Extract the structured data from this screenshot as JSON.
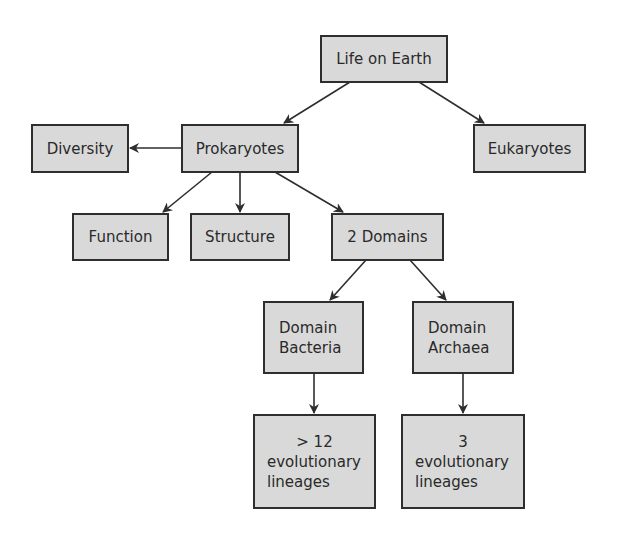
{
  "diagram": {
    "title": "Life on Earth",
    "colors": {
      "background": "#ffffff",
      "node_fill": "#d9d9d9",
      "node_border": "#2e2e2e",
      "text": "#2a2a2a",
      "edge": "#2e2e2e"
    },
    "nodes": {
      "life_on_earth": {
        "label": "Life on Earth"
      },
      "prokaryotes": {
        "label": "Prokaryotes"
      },
      "eukaryotes": {
        "label": "Eukaryotes"
      },
      "diversity": {
        "label": "Diversity"
      },
      "function": {
        "label": "Function"
      },
      "structure": {
        "label": "Structure"
      },
      "two_domains": {
        "label": "2 Domains"
      },
      "domain_bacteria": {
        "lines": [
          "Domain",
          "Bacteria"
        ]
      },
      "domain_archaea": {
        "lines": [
          "Domain",
          "Archaea"
        ]
      },
      "bacteria_lineages": {
        "lines": [
          "> 12",
          "evolutionary",
          "lineages"
        ]
      },
      "archaea_lineages": {
        "lines": [
          "3",
          "evolutionary",
          "lineages"
        ]
      }
    },
    "edges": [
      {
        "from": "Life on Earth",
        "to": "Prokaryotes"
      },
      {
        "from": "Life on Earth",
        "to": "Eukaryotes"
      },
      {
        "from": "Prokaryotes",
        "to": "Diversity"
      },
      {
        "from": "Prokaryotes",
        "to": "Function"
      },
      {
        "from": "Prokaryotes",
        "to": "Structure"
      },
      {
        "from": "Prokaryotes",
        "to": "2 Domains"
      },
      {
        "from": "2 Domains",
        "to": "Domain Bacteria"
      },
      {
        "from": "2 Domains",
        "to": "Domain Archaea"
      },
      {
        "from": "Domain Bacteria",
        "to": "> 12 evolutionary lineages"
      },
      {
        "from": "Domain Archaea",
        "to": "3 evolutionary lineages"
      }
    ]
  }
}
